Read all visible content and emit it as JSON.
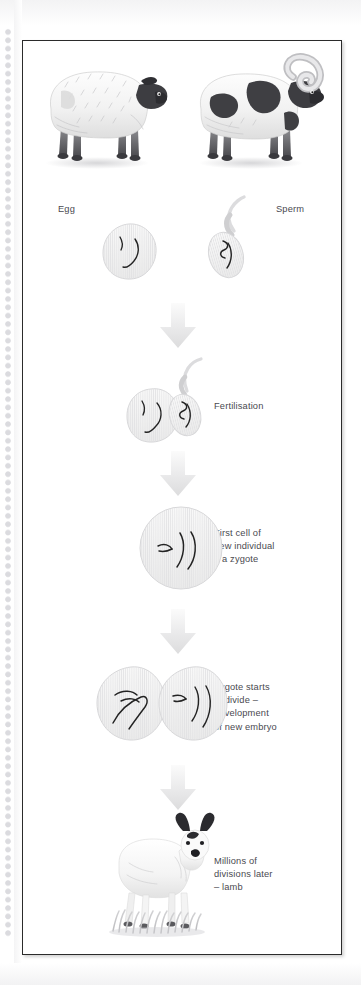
{
  "figure": {
    "frame_color": "#2b2b2b",
    "text_color": "#4a4a50",
    "arrow_color": "#e2e2e4",
    "cell_fill": "#f4f4f4",
    "cell_stroke": "#d5d5d7",
    "chromosome_color": "#1d1d1d"
  },
  "stages": [
    {
      "id": "parents",
      "left_label": "",
      "right_label": "",
      "animals": [
        {
          "name": "ewe",
          "coat": "white",
          "horns": false
        },
        {
          "name": "ram",
          "coat": "white with dark patches",
          "horns": true
        }
      ]
    },
    {
      "id": "gametes",
      "left_label": "Egg",
      "right_label": "Sperm",
      "cells": [
        {
          "name": "egg-cell",
          "chromosomes": 2
        },
        {
          "name": "sperm-cell",
          "chromosomes": 2
        }
      ]
    },
    {
      "id": "fertilisation",
      "label": "Fertilisation",
      "cells": [
        {
          "name": "egg-cell",
          "chromosomes": 2
        },
        {
          "name": "sperm-cell",
          "chromosomes": 2
        }
      ]
    },
    {
      "id": "zygote",
      "label": "First cell of\nnew individual\n– a zygote",
      "cells": [
        {
          "name": "zygote-cell",
          "chromosomes": 4
        }
      ]
    },
    {
      "id": "division",
      "label": "Zygote starts\nto divide –\ndevelopment\nof new embryo",
      "cells": [
        {
          "name": "daughter-cell-left",
          "chromosomes": 4
        },
        {
          "name": "daughter-cell-right",
          "chromosomes": 4
        }
      ]
    },
    {
      "id": "lamb",
      "label": "Millions of\ndivisions later\n– lamb",
      "animals": [
        {
          "name": "lamb",
          "coat": "white",
          "horns": false
        }
      ]
    }
  ],
  "arrows": [
    {
      "name": "arrow-to-fertilisation"
    },
    {
      "name": "arrow-to-zygote"
    },
    {
      "name": "arrow-to-division"
    },
    {
      "name": "arrow-to-lamb"
    }
  ]
}
